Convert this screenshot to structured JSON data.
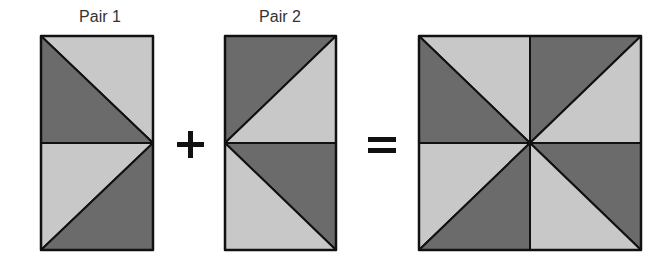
{
  "diagram": {
    "colors": {
      "dark": "#6b6b6b",
      "light": "#c8c8c8",
      "stroke": "#111111",
      "text": "#333333"
    },
    "pair1": {
      "label": "Pair 1",
      "top_half": {
        "dark": "lower-left triangle",
        "light": "upper-right triangle",
        "diagonal": "top-left to right-middle"
      },
      "bottom_half": {
        "light": "upper-left triangle",
        "dark": "lower-right triangle",
        "diagonal": "right-middle to bottom-left"
      }
    },
    "operator_plus": "+",
    "pair2": {
      "label": "Pair 2",
      "top_half": {
        "dark": "upper-left triangle",
        "light": "lower-right triangle",
        "diagonal": "left-middle to top-right"
      },
      "bottom_half": {
        "dark": "upper-right triangle",
        "light": "lower-left triangle",
        "diagonal": "left-middle to bottom-right"
      }
    },
    "operator_equals": "=",
    "result": {
      "description": "Pinwheel block composed of Pair 1 (left column) and Pair 2 (right column)",
      "quadrants": 4,
      "triangles": 8
    }
  }
}
